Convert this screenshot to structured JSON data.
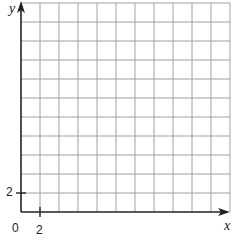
{
  "graph": {
    "x_axis_label": "x",
    "y_axis_label": "y",
    "origin_label": "0",
    "x_tick_label": "2",
    "y_tick_label": "2",
    "grid": {
      "columns": 11,
      "rows": 11,
      "cell_size_units": 2,
      "line_color": "#a0a0a0",
      "axis_color": "#222222"
    }
  }
}
